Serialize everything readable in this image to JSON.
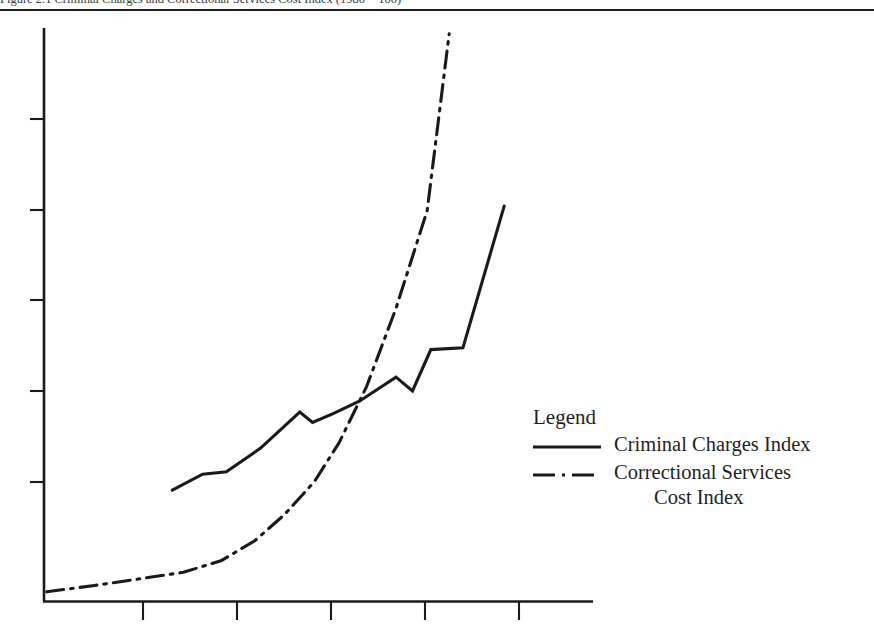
{
  "caption": {
    "text": "Figure 2.1  Criminal Charges and Correctional Services Cost Index (1980 = 100)"
  },
  "legend": {
    "title": "Legend",
    "entries": [
      {
        "label": "Criminal Charges Index",
        "label_line2": "",
        "style": "solid",
        "swatch_name": "solid-line-swatch"
      },
      {
        "label": "Correctional Services",
        "label_line2": "Cost Index",
        "style": "dash-dot",
        "swatch_name": "dash-dot-line-swatch"
      }
    ]
  },
  "chart_data": {
    "type": "line",
    "title": "",
    "xlabel": "",
    "ylabel": "",
    "grid": false,
    "legend_position": "right-middle",
    "xlim": [
      0,
      6
    ],
    "ylim": [
      0,
      10
    ],
    "x_ticks": [
      1,
      2,
      3,
      4,
      5
    ],
    "x_tick_labels": [
      "",
      "",
      "",
      "",
      ""
    ],
    "y_ticks": [
      2,
      4,
      6,
      8,
      10
    ],
    "y_tick_labels": [
      "",
      "",
      "",
      "",
      ""
    ],
    "series": [
      {
        "name": "Criminal Charges Index",
        "style": "solid",
        "color": "#1a1a1a",
        "x": [
          1.4,
          1.73,
          1.99,
          2.36,
          2.79,
          2.93,
          3.16,
          3.44,
          3.84,
          4.02,
          4.22,
          4.57,
          5.02
        ],
        "y": [
          1.93,
          2.21,
          2.25,
          2.66,
          3.29,
          3.11,
          3.27,
          3.48,
          3.9,
          3.66,
          4.38,
          4.41,
          6.88
        ]
      },
      {
        "name": "Correctional Services Cost Index",
        "style": "dash-dot",
        "color": "#1a1a1a",
        "x": [
          0.03,
          0.55,
          1.1,
          1.52,
          1.93,
          2.3,
          2.62,
          2.95,
          3.22,
          3.52,
          3.84,
          4.18,
          4.42
        ],
        "y": [
          0.16,
          0.27,
          0.4,
          0.5,
          0.7,
          1.05,
          1.5,
          2.08,
          2.76,
          3.74,
          5.1,
          6.8,
          9.88
        ]
      }
    ]
  }
}
